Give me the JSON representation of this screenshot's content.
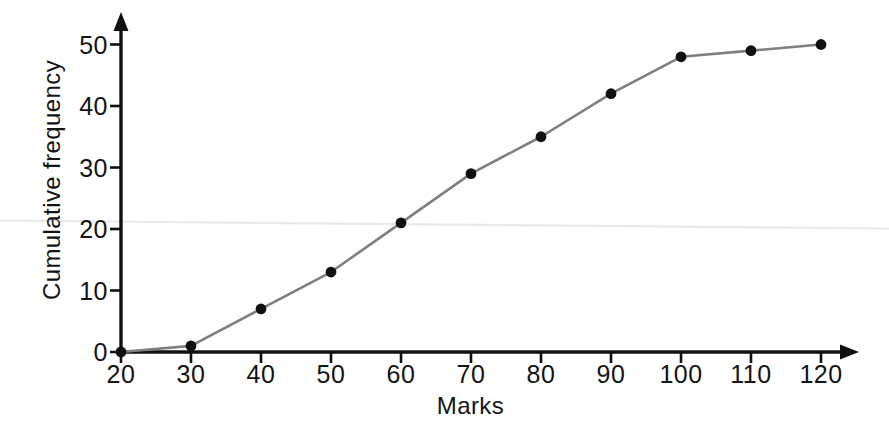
{
  "chart_data": {
    "type": "line",
    "title": "",
    "subtitle": "",
    "xlabel": "Marks",
    "ylabel": "Cumulative frequency",
    "xlim": [
      20,
      120
    ],
    "ylim": [
      0,
      50
    ],
    "xticks": [
      20,
      30,
      40,
      50,
      60,
      70,
      80,
      90,
      100,
      110,
      120
    ],
    "yticks": [
      0,
      10,
      20,
      30,
      40,
      50
    ],
    "xtick_labels": [
      "20",
      "30",
      "40",
      "50",
      "60",
      "70",
      "80",
      "90",
      "100",
      "110",
      "120"
    ],
    "ytick_labels": [
      "0",
      "10",
      "20",
      "30",
      "40",
      "50"
    ],
    "grid": false,
    "legend": false,
    "legend_position": "none",
    "markers": "filled-circle",
    "series": [
      {
        "name": "Cumulative frequency",
        "x": [
          20,
          30,
          40,
          50,
          60,
          70,
          80,
          90,
          100,
          110,
          120
        ],
        "values": [
          0,
          1,
          7,
          13,
          21,
          29,
          35,
          42,
          48,
          49,
          50
        ],
        "line_color": "#7f7f7f",
        "marker_color": "#101010"
      }
    ],
    "annotations": []
  },
  "axes": {
    "x_arrow": true,
    "y_arrow": true,
    "axis_color": "#101010"
  },
  "colors": {
    "background": "#ffffff",
    "axis": "#101010",
    "line": "#7f7f7f",
    "marker": "#101010",
    "text": "#141414",
    "artifact_line": "#e8e8ec"
  }
}
